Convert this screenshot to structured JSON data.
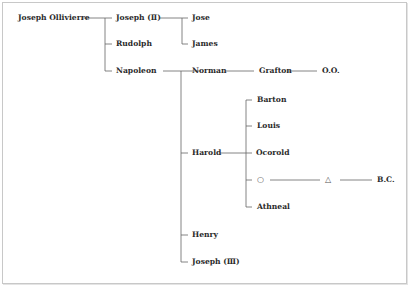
{
  "diagram": {
    "type": "family-tree",
    "colors": {
      "line": "#666666",
      "text": "#2a2a2a",
      "frame": "#c8c8c8"
    },
    "root": {
      "label": "Joseph Ollivierre",
      "children": [
        {
          "label": "Joseph (Ⅱ)",
          "children": [
            {
              "label": "Jose"
            },
            {
              "label": "James"
            }
          ]
        },
        {
          "label": "Rudolph"
        },
        {
          "label": "Napoleon",
          "children": [
            {
              "label": "Norman",
              "children": [
                {
                  "label": "Grafton",
                  "children": [
                    {
                      "label": "O.O."
                    }
                  ]
                }
              ]
            },
            {
              "label": "Harold",
              "children": [
                {
                  "label": "Barton"
                },
                {
                  "label": "Louis"
                },
                {
                  "label": "Ocorold"
                },
                {
                  "label": "○",
                  "children": [
                    {
                      "label": "△",
                      "children": [
                        {
                          "label": "B.C."
                        }
                      ]
                    }
                  ]
                },
                {
                  "label": "Athneal"
                }
              ]
            },
            {
              "label": "Henry"
            },
            {
              "label": "Joseph (Ⅲ)"
            }
          ]
        }
      ]
    }
  },
  "labels": {
    "joseph_ollivierre": "Joseph Ollivierre",
    "joseph_ii": "Joseph (Ⅱ)",
    "jose": "Jose",
    "james": "James",
    "rudolph": "Rudolph",
    "napoleon": "Napoleon",
    "norman": "Norman",
    "grafton": "Grafton",
    "oo": "O.O.",
    "barton": "Barton",
    "louis": "Louis",
    "harold": "Harold",
    "ocorold": "Ocorold",
    "unknown_circle": "○",
    "unknown_triangle": "△",
    "bc": "B.C.",
    "athneal": "Athneal",
    "henry": "Henry",
    "joseph_iii": "Joseph (Ⅲ)"
  }
}
